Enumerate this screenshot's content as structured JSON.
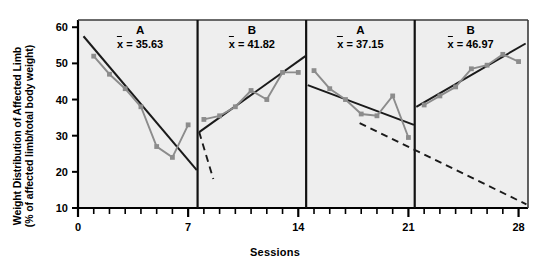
{
  "chart_data": {
    "type": "line",
    "title": "",
    "xlabel": "Sessions",
    "ylabel": "Weight Distribution of Affected Limb (% of affected limb/total body weight)",
    "ylabel_line1": "Weight Distribution of Affected Limb",
    "ylabel_line2": "(% of affected limb/total body weight)",
    "xlim": [
      0,
      28.6
    ],
    "ylim": [
      10,
      62
    ],
    "xticks_major": [
      0,
      7,
      14,
      21,
      28
    ],
    "xtick_labels": [
      "0",
      "7",
      "14",
      "21",
      "28"
    ],
    "xticks_minor_step": 1,
    "yticks": [
      10,
      20,
      30,
      40,
      50,
      60
    ],
    "ytick_labels": [
      "10",
      "20",
      "30",
      "40",
      "50",
      "60"
    ],
    "grid": false,
    "legend": "none",
    "marker": "square",
    "series_color": "#8c8c8c",
    "trend_color": "#1a1a1a",
    "plot_background": "#eeeeee",
    "axis_color": "#000000",
    "series": [
      {
        "name": "Weight distribution",
        "x": [
          1,
          2,
          3,
          4,
          5,
          6,
          7
        ],
        "y": [
          52.0,
          47.0,
          43.0,
          38.0,
          27.0,
          24.0,
          33.0
        ]
      }
    ],
    "phases": [
      {
        "label": "A",
        "mean_label": "x̅ = 35.63",
        "mean": 35.63,
        "x_start": 0.3,
        "x_end": 7.6,
        "points": [
          {
            "x": 1,
            "y": 52.0
          },
          {
            "x": 2,
            "y": 47.0
          },
          {
            "x": 3,
            "y": 43.0
          },
          {
            "x": 4,
            "y": 38.0
          },
          {
            "x": 5,
            "y": 27.0
          },
          {
            "x": 6,
            "y": 24.0
          },
          {
            "x": 7,
            "y": 33.0
          }
        ],
        "trend": {
          "x1": 0.35,
          "y1": 57.5,
          "x2": 7.55,
          "y2": 20.5,
          "style": "solid"
        },
        "trend_extension": null
      },
      {
        "label": "B",
        "mean_label": "x̅ = 41.82",
        "mean": 41.82,
        "x_start": 7.6,
        "x_end": 14.5,
        "points": [
          {
            "x": 8,
            "y": 34.5
          },
          {
            "x": 9,
            "y": 35.5
          },
          {
            "x": 10,
            "y": 38.0
          },
          {
            "x": 11,
            "y": 42.5
          },
          {
            "x": 12,
            "y": 40.0
          },
          {
            "x": 13,
            "y": 47.5
          },
          {
            "x": 14,
            "y": 47.5
          }
        ],
        "trend": {
          "x1": 7.7,
          "y1": 31.0,
          "x2": 14.45,
          "y2": 52.0,
          "style": "solid"
        },
        "trend_extension": {
          "x1": 7.7,
          "y1": 31.0,
          "x2": 8.6,
          "y2": 18.0,
          "style": "dashed"
        }
      },
      {
        "label": "A",
        "mean_label": "x̅ = 37.15",
        "mean": 37.15,
        "x_start": 14.5,
        "x_end": 21.4,
        "points": [
          {
            "x": 15,
            "y": 48.0
          },
          {
            "x": 16,
            "y": 43.0
          },
          {
            "x": 17,
            "y": 40.0
          },
          {
            "x": 18,
            "y": 36.0
          },
          {
            "x": 19,
            "y": 35.5
          },
          {
            "x": 20,
            "y": 41.0
          },
          {
            "x": 21,
            "y": 29.5
          }
        ],
        "trend": {
          "x1": 14.6,
          "y1": 44.0,
          "x2": 21.35,
          "y2": 33.0,
          "style": "solid"
        },
        "trend_extension": null
      },
      {
        "label": "B",
        "mean_label": "x̅ = 46.97",
        "mean": 46.97,
        "x_start": 21.4,
        "x_end": 28.5,
        "points": [
          {
            "x": 22,
            "y": 38.5
          },
          {
            "x": 23,
            "y": 41.0
          },
          {
            "x": 24,
            "y": 43.5
          },
          {
            "x": 25,
            "y": 48.5
          },
          {
            "x": 26,
            "y": 49.5
          },
          {
            "x": 27,
            "y": 52.5
          },
          {
            "x": 28,
            "y": 50.5
          }
        ],
        "trend": {
          "x1": 21.5,
          "y1": 38.0,
          "x2": 28.45,
          "y2": 55.5,
          "style": "solid"
        },
        "trend_extension": {
          "x1": 17.9,
          "y1": 33.5,
          "x2": 28.5,
          "y2": 11.0,
          "style": "dashed"
        }
      }
    ],
    "phase_dividers": [
      7.6,
      14.5,
      21.4
    ]
  }
}
